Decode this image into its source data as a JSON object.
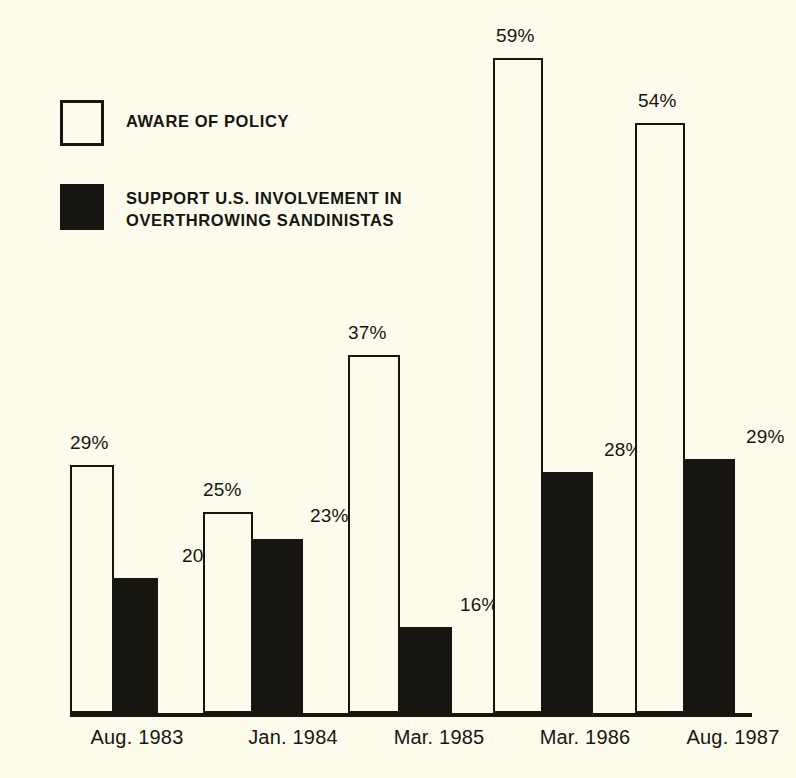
{
  "chart_data": {
    "type": "bar",
    "title": "",
    "subtitle": "",
    "xlabel": "",
    "ylabel": "",
    "grid": false,
    "legend_position": "top-left",
    "axis_note": "truncated value axis; bar tops encode labeled percentages",
    "categories": [
      "Aug. 1983",
      "Jan. 1984",
      "Mar. 1985",
      "Mar. 1986",
      "Aug. 1987"
    ],
    "series": [
      {
        "name": "AWARE OF POLICY",
        "style": "open",
        "color": "#fdfcec",
        "values": [
          29,
          25,
          37,
          59,
          54
        ],
        "value_labels": [
          "29%",
          "25%",
          "37%",
          "59%",
          "54%"
        ]
      },
      {
        "name": "SUPPORT U.S. INVOLVEMENT IN OVERTHROWING SANDINISTAS",
        "style": "filled",
        "color": "#17150f",
        "values": [
          20,
          23,
          16,
          28,
          29
        ],
        "value_labels": [
          "20%",
          "23%",
          "16%",
          "28%",
          "29%"
        ]
      }
    ]
  },
  "legend": {
    "items": [
      {
        "label": "AWARE OF POLICY",
        "swatch": "open-square-swatch"
      },
      {
        "label": "SUPPORT U.S. INVOLVEMENT IN\nOVERTHROWING SANDINISTAS",
        "swatch": "filled-square-swatch"
      }
    ]
  },
  "geometry": {
    "baseline_y": 713,
    "bars": [
      {
        "series": 0,
        "category": 0,
        "x": 70,
        "top": 465,
        "w": 44
      },
      {
        "series": 1,
        "category": 0,
        "x": 114,
        "top": 578,
        "w": 44
      },
      {
        "series": 0,
        "category": 1,
        "x": 203,
        "top": 512,
        "w": 50
      },
      {
        "series": 1,
        "category": 1,
        "x": 253,
        "top": 539,
        "w": 50
      },
      {
        "series": 0,
        "category": 2,
        "x": 348,
        "top": 355,
        "w": 52
      },
      {
        "series": 1,
        "category": 2,
        "x": 400,
        "top": 627,
        "w": 52
      },
      {
        "series": 0,
        "category": 3,
        "x": 493,
        "top": 58,
        "w": 50
      },
      {
        "series": 1,
        "category": 3,
        "x": 543,
        "top": 472,
        "w": 50
      },
      {
        "series": 0,
        "category": 4,
        "x": 635,
        "top": 123,
        "w": 50
      },
      {
        "series": 1,
        "category": 4,
        "x": 685,
        "top": 459,
        "w": 50
      }
    ],
    "value_label_pos": [
      {
        "x": 70,
        "y": 432
      },
      {
        "x": 182,
        "y": 545
      },
      {
        "x": 203,
        "y": 479
      },
      {
        "x": 310,
        "y": 505
      },
      {
        "x": 348,
        "y": 322
      },
      {
        "x": 460,
        "y": 594
      },
      {
        "x": 496,
        "y": 25
      },
      {
        "x": 604,
        "y": 439
      },
      {
        "x": 638,
        "y": 90
      },
      {
        "x": 746,
        "y": 426
      }
    ],
    "tick_label_x": [
      72,
      228,
      374,
      520,
      668
    ]
  }
}
